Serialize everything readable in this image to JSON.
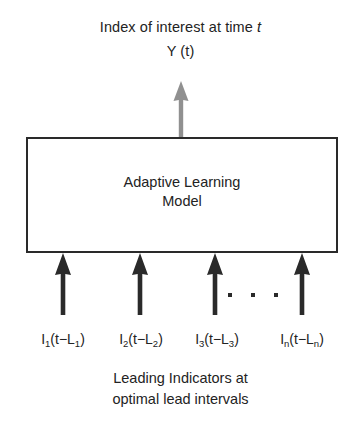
{
  "diagram": {
    "colors": {
      "background": "#ffffff",
      "box_border": "#2a2a2a",
      "text": "#232323",
      "input_arrow": "#2a2a2a",
      "output_arrow": "#909090"
    },
    "output": {
      "title_prefix": "Index of interest at time ",
      "title_variable": "t",
      "symbol": "Y (t)",
      "arrow_icon": "up-arrow-icon",
      "arrow_color": "#909090"
    },
    "model_box": {
      "label_line_1": "Adaptive Learning",
      "label_line_2": "Model"
    },
    "ellipsis": {
      "glyph": "·",
      "count": 3
    },
    "inputs": [
      {
        "index": "1",
        "symbol": "I",
        "lag": "L",
        "label_html_prefix": "I",
        "sub_a": "1",
        "mid": "(t−L",
        "sub_b": "1",
        "suffix": ")",
        "arrow_icon": "up-arrow-icon"
      },
      {
        "index": "2",
        "symbol": "I",
        "lag": "L",
        "label_html_prefix": "I",
        "sub_a": "2",
        "mid": "(t−L",
        "sub_b": "2",
        "suffix": ")",
        "arrow_icon": "up-arrow-icon"
      },
      {
        "index": "3",
        "symbol": "I",
        "lag": "L",
        "label_html_prefix": "I",
        "sub_a": "3",
        "mid": "(t−L",
        "sub_b": "3",
        "suffix": ")",
        "arrow_icon": "up-arrow-icon"
      },
      {
        "index": "n",
        "symbol": "I",
        "lag": "L",
        "label_html_prefix": "I",
        "sub_a": "n",
        "mid": "(t−L",
        "sub_b": "n",
        "suffix": ")",
        "arrow_icon": "up-arrow-icon"
      }
    ],
    "caption": {
      "line_1": "Leading Indicators at",
      "line_2": "optimal lead intervals"
    }
  }
}
